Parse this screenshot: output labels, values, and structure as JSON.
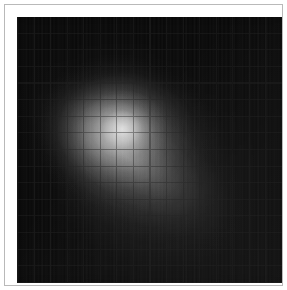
{
  "figure": {
    "title": "",
    "background_color": "#ffffff",
    "frame_color": "#b9b9b9",
    "plot_background_color": "#040404",
    "alt_text": "Grayscale heatmap image of a diffuse elongated bright source with a tail, overlaid with a coordinate grid"
  },
  "chart_data": {
    "type": "heatmap",
    "title": "",
    "subtitle": "",
    "xlabel": "",
    "ylabel": "",
    "colormap": "gray",
    "grid": true,
    "grid_columns": 16,
    "grid_rows": 16,
    "legend": "none",
    "xlim": [
      0,
      16
    ],
    "ylim": [
      0,
      16
    ],
    "xtick_labels": [],
    "ytick_labels": [],
    "value_range": [
      0,
      120
    ],
    "peak_value": 120,
    "peak_cell": [
      2,
      3
    ],
    "colors": {
      "minimum": "#040404",
      "low": "#101010",
      "mid": "#3c3c3c",
      "high": "#6e6e6e",
      "peak": "#7d7d7d",
      "grid_line_light": "#171717",
      "grid_line_dark": "#0b0b0b"
    },
    "annotations": [
      "diffuse bright source near upper-left of center",
      "tail elongated toward lower-right",
      "faint vertical streak noise in lower-right quadrant"
    ],
    "values": [
      [
        2,
        2,
        2,
        2,
        2,
        2,
        2,
        2,
        2,
        2,
        2,
        2,
        2,
        2,
        2,
        2
      ],
      [
        2,
        2,
        2,
        2,
        3,
        3,
        3,
        2,
        2,
        2,
        2,
        2,
        2,
        2,
        2,
        2
      ],
      [
        2,
        2,
        3,
        3,
        4,
        5,
        5,
        4,
        3,
        3,
        2,
        2,
        2,
        2,
        2,
        2
      ],
      [
        2,
        3,
        4,
        6,
        9,
        12,
        12,
        9,
        6,
        4,
        3,
        3,
        2,
        2,
        2,
        2
      ],
      [
        2,
        3,
        6,
        14,
        30,
        44,
        42,
        28,
        15,
        8,
        5,
        3,
        3,
        2,
        2,
        2
      ],
      [
        2,
        4,
        10,
        34,
        72,
        96,
        88,
        60,
        32,
        16,
        8,
        5,
        3,
        2,
        2,
        2
      ],
      [
        2,
        5,
        14,
        52,
        104,
        120,
        110,
        80,
        48,
        26,
        13,
        7,
        4,
        3,
        2,
        2
      ],
      [
        2,
        5,
        14,
        50,
        96,
        114,
        104,
        80,
        54,
        32,
        18,
        10,
        5,
        3,
        2,
        2
      ],
      [
        2,
        4,
        11,
        34,
        66,
        84,
        82,
        68,
        50,
        33,
        20,
        11,
        6,
        4,
        3,
        2
      ],
      [
        2,
        3,
        7,
        20,
        40,
        54,
        56,
        52,
        42,
        30,
        20,
        12,
        7,
        4,
        3,
        2
      ],
      [
        2,
        3,
        5,
        11,
        22,
        32,
        36,
        36,
        32,
        25,
        18,
        12,
        7,
        5,
        3,
        2
      ],
      [
        2,
        2,
        4,
        7,
        12,
        18,
        22,
        24,
        23,
        19,
        15,
        10,
        7,
        5,
        3,
        2
      ],
      [
        2,
        2,
        3,
        5,
        7,
        10,
        13,
        15,
        15,
        14,
        11,
        9,
        6,
        4,
        3,
        2
      ],
      [
        2,
        2,
        2,
        3,
        5,
        6,
        8,
        9,
        10,
        9,
        8,
        7,
        5,
        4,
        3,
        2
      ],
      [
        2,
        2,
        2,
        3,
        3,
        4,
        5,
        6,
        6,
        6,
        6,
        5,
        4,
        3,
        3,
        2
      ],
      [
        2,
        2,
        2,
        2,
        3,
        3,
        3,
        4,
        4,
        4,
        4,
        4,
        3,
        3,
        2,
        2
      ]
    ]
  }
}
